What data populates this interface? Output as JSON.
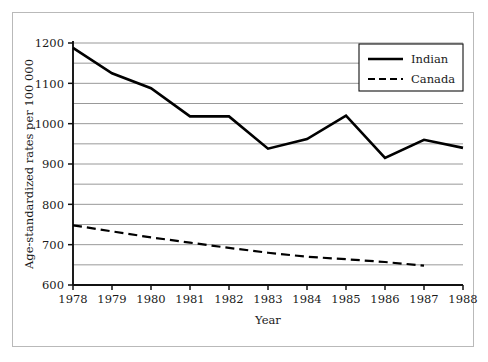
{
  "chart_data": {
    "type": "line",
    "title": "",
    "xlabel": "Year",
    "ylabel": "Age-standardized rates per 100 000",
    "x": [
      1978,
      1979,
      1980,
      1981,
      1982,
      1983,
      1984,
      1985,
      1986,
      1987,
      1988
    ],
    "xtick_labels": [
      "1978",
      "1979",
      "1980",
      "1981",
      "1982",
      "1983",
      "1984",
      "1985",
      "1986",
      "1987",
      "1988"
    ],
    "ytick_labels": [
      "600",
      "700",
      "800",
      "900",
      "1000",
      "1100",
      "1200"
    ],
    "ytick_values": [
      600,
      700,
      800,
      900,
      1000,
      1100,
      1200
    ],
    "gridline_values": [
      600,
      650,
      700,
      750,
      800,
      850,
      900,
      950,
      1000,
      1050,
      1100,
      1150,
      1200
    ],
    "xlim": [
      1978,
      1988
    ],
    "ylim": [
      600,
      1200
    ],
    "grid": "horizontal",
    "legend_position": "top-right",
    "series": [
      {
        "name": "Indian",
        "style": "solid",
        "color": "#000000",
        "width": 2.6,
        "x": [
          1978,
          1979,
          1980,
          1981,
          1982,
          1983,
          1984,
          1985,
          1986,
          1987,
          1988
        ],
        "values": [
          1188,
          1125,
          1088,
          1018,
          1018,
          938,
          962,
          1020,
          915,
          960,
          940
        ]
      },
      {
        "name": "Canada",
        "style": "dashed",
        "color": "#000000",
        "width": 2.2,
        "x": [
          1978,
          1979,
          1980,
          1981,
          1982,
          1983,
          1984,
          1985,
          1986,
          1987
        ],
        "values": [
          748,
          733,
          718,
          705,
          692,
          680,
          670,
          664,
          657,
          648
        ]
      }
    ]
  },
  "legend": {
    "items": [
      {
        "label": "Indian",
        "style": "solid"
      },
      {
        "label": "Canada",
        "style": "dashed"
      }
    ]
  },
  "axes": {
    "x_title": "Year",
    "y_title": "Age-standardized rates per 100 000"
  }
}
